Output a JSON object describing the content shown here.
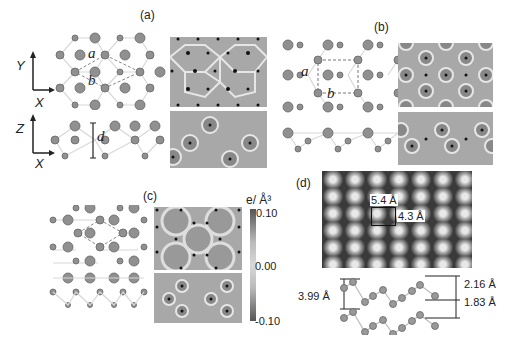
{
  "figure": {
    "panels": [
      {
        "id": "a",
        "label": "(a)",
        "lattice_labels": [
          "a",
          "b"
        ],
        "side_label": "d",
        "top_axes": {
          "vertical": "Y",
          "horizontal": "X"
        },
        "side_axes": {
          "vertical": "Z",
          "horizontal": "X"
        }
      },
      {
        "id": "b",
        "label": "(b)",
        "lattice_labels": [
          "a",
          "b"
        ]
      },
      {
        "id": "c",
        "label": "(c)",
        "colorbar": {
          "unit": "e/ Å³",
          "max": "0.10",
          "mid": "0.00",
          "min": "-0.10"
        }
      },
      {
        "id": "d",
        "label": "(d)",
        "stm": {
          "width_label": "5.4 Å",
          "height_label": "4.3 Å"
        },
        "side": {
          "interlayer": "3.99 Å",
          "upper": "2.16 Å",
          "lower": "1.83 Å"
        }
      }
    ]
  },
  "colors": {
    "atom": "#8a8a8a",
    "bond": "#d0d0d0",
    "map_bg": "#a8a8a8",
    "dot": "#111111"
  }
}
